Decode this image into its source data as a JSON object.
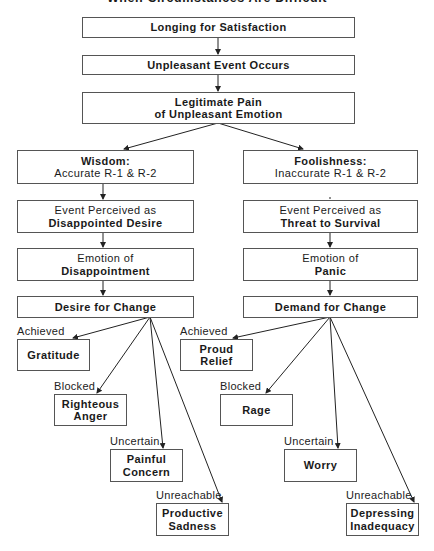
{
  "title": "When Circumstances Are Difficult",
  "top_flow": {
    "longing": "Longing for Satisfaction",
    "event": "Unpleasant Event Occurs",
    "pain_line1": "Legitimate Pain",
    "pain_line2": "of Unpleasant Emotion"
  },
  "left_branch": {
    "head_bold": "Wisdom:",
    "head_text": "Accurate R-1 & R-2",
    "perceived_line1": "Event Perceived as",
    "perceived_bold": "Disappointed Desire",
    "emotion_line1": "Emotion of",
    "emotion_bold": "Disappointment",
    "change": "Desire for Change",
    "outcomes": [
      {
        "condition": "Achieved",
        "line1": "Gratitude",
        "line2": ""
      },
      {
        "condition": "Blocked",
        "line1": "Righteous",
        "line2": "Anger"
      },
      {
        "condition": "Uncertain",
        "line1": "Painful",
        "line2": "Concern"
      },
      {
        "condition": "Unreachable",
        "line1": "Productive",
        "line2": "Sadness"
      }
    ]
  },
  "right_branch": {
    "head_bold": "Foolishness:",
    "head_text": "Inaccurate R-1 & R-2",
    "perceived_line1": "Event Perceived as",
    "perceived_bold": "Threat to Survival",
    "emotion_line1": "Emotion of",
    "emotion_bold": "Panic",
    "change": "Demand for Change",
    "outcomes": [
      {
        "condition": "Achieved",
        "line1": "Proud",
        "line2": "Relief"
      },
      {
        "condition": "Blocked",
        "line1": "Rage",
        "line2": ""
      },
      {
        "condition": "Uncertain",
        "line1": "Worry",
        "line2": ""
      },
      {
        "condition": "Unreachable",
        "line1": "Depressing",
        "line2": "Inadequacy"
      }
    ]
  }
}
